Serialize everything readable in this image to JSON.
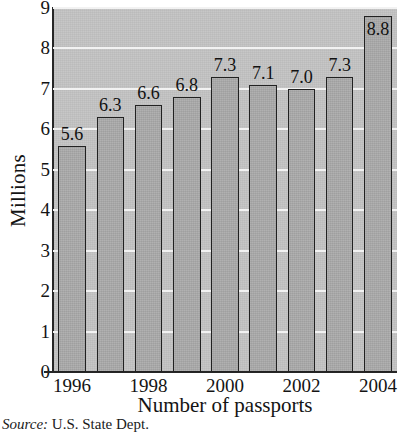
{
  "chart_data": {
    "type": "bar",
    "title": "",
    "xlabel": "Number of passports",
    "ylabel": "Millions",
    "categories": [
      "1996",
      "1997",
      "1998",
      "1999",
      "2000",
      "2001",
      "2002",
      "2003",
      "2004"
    ],
    "values": [
      5.6,
      6.3,
      6.6,
      6.8,
      7.3,
      7.1,
      7.0,
      7.3,
      8.8
    ],
    "value_labels": [
      "5.6",
      "6.3",
      "6.6",
      "6.8",
      "7.3",
      "7.1",
      "7.0",
      "7.3",
      "8.8"
    ],
    "ylim": [
      0,
      9
    ],
    "ytick_labels": [
      "0",
      "1",
      "2",
      "3",
      "4",
      "5",
      "6",
      "7",
      "8",
      "9"
    ],
    "ytick_values": [
      0,
      1,
      2,
      3,
      4,
      5,
      6,
      7,
      8,
      9
    ],
    "xtick_labels": [
      "1996",
      "1998",
      "2000",
      "2002",
      "2004"
    ],
    "xtick_categories": [
      "1996",
      "1998",
      "2000",
      "2002",
      "2004"
    ],
    "grid": "horizontal",
    "legend": "none",
    "bar_color": "#ababab",
    "bar_edge_color": "#212121",
    "plot_background": "#c4c4c4",
    "gridline_color": "#f2f2f2",
    "axis_color": "#262626",
    "label_inside_last_bar": true
  },
  "source_note": {
    "prefix": "Source:",
    "text": "U.S. State Dept."
  }
}
